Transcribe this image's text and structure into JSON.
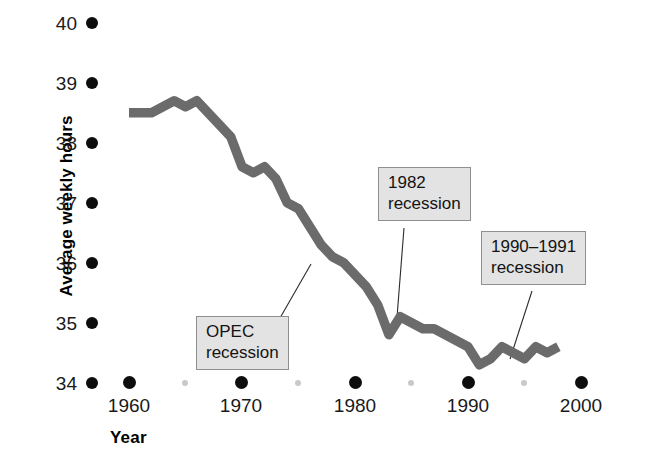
{
  "chart_data": {
    "type": "line",
    "title": "",
    "xlabel": "Year",
    "ylabel": "Average weekly hours",
    "xlim": [
      1958,
      2001
    ],
    "ylim": [
      34,
      40
    ],
    "grid": false,
    "legend": false,
    "series_color": "#6b6b6b",
    "x_ticks_major": [
      "1960",
      "1970",
      "1980",
      "1990",
      "2000"
    ],
    "x_ticks_minor": [
      "1965",
      "1975",
      "1985",
      "1995"
    ],
    "y_ticks": [
      "40",
      "39",
      "38",
      "37",
      "36",
      "35",
      "34"
    ],
    "series": [
      {
        "name": "Average weekly hours",
        "x": [
          1960,
          1961,
          1962,
          1963,
          1964,
          1965,
          1966,
          1967,
          1968,
          1969,
          1970,
          1971,
          1972,
          1973,
          1974,
          1975,
          1976,
          1977,
          1978,
          1979,
          1980,
          1981,
          1982,
          1983,
          1984,
          1985,
          1986,
          1987,
          1988,
          1989,
          1990,
          1991,
          1992,
          1993,
          1994,
          1995,
          1996,
          1997,
          1998
        ],
        "values": [
          38.5,
          38.5,
          38.5,
          38.6,
          38.7,
          38.6,
          38.7,
          38.5,
          38.3,
          38.1,
          37.6,
          37.5,
          37.6,
          37.4,
          37.0,
          36.9,
          36.6,
          36.3,
          36.1,
          36.0,
          35.8,
          35.6,
          35.3,
          34.8,
          35.1,
          35.0,
          34.9,
          34.9,
          34.8,
          34.7,
          34.6,
          34.3,
          34.4,
          34.6,
          34.5,
          34.4,
          34.6,
          34.5,
          34.6
        ],
        "annotations": [
          {
            "id": "opec",
            "label_line1": "OPEC",
            "label_line2": "recession",
            "points_at_x": 1975,
            "points_at_y": 36.9
          },
          {
            "id": "recession-1982",
            "label_line1": "1982",
            "label_line2": "recession",
            "points_at_x": 1982,
            "points_at_y": 35.3
          },
          {
            "id": "recession-1990-1991",
            "label_line1": "1990–1991",
            "label_line2": "recession",
            "points_at_x": 1991,
            "points_at_y": 34.3
          }
        ]
      }
    ]
  },
  "axes": {
    "y_title": "Average weekly hours",
    "x_title": "Year",
    "y_tick_labels": [
      "40",
      "39",
      "38",
      "37",
      "36",
      "35",
      "34"
    ],
    "x_tick_labels": [
      "1960",
      "1970",
      "1980",
      "1990",
      "2000"
    ]
  },
  "callouts": {
    "opec": {
      "line1": "OPEC",
      "line2": "recession"
    },
    "r1982": {
      "line1": "1982",
      "line2": "recession"
    },
    "r1990": {
      "line1": "1990–1991",
      "line2": "recession"
    }
  },
  "colors": {
    "line": "#6b6b6b",
    "dot_major": "#0d0d0d",
    "dot_minor": "#c9c9c9",
    "callout_bg": "#e3e3e3",
    "callout_border": "#8f8f8f"
  }
}
